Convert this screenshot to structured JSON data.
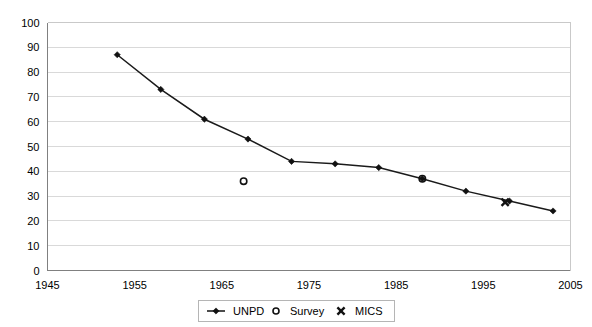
{
  "chart_data": {
    "type": "line",
    "title": "",
    "subtitle": "",
    "xlabel": "",
    "ylabel": "",
    "xlim": [
      1945,
      2005
    ],
    "ylim": [
      0,
      100
    ],
    "grid": true,
    "grid_axis": "y",
    "legend_position": "bottom-center",
    "x_ticks": [
      1945,
      1955,
      1965,
      1975,
      1985,
      1995,
      2005
    ],
    "x_tick_labels": [
      "1945",
      "1955",
      "1965",
      "1975",
      "1985",
      "1995",
      "2005"
    ],
    "y_ticks": [
      0,
      10,
      20,
      30,
      40,
      50,
      60,
      70,
      80,
      90,
      100
    ],
    "y_tick_labels": [
      "0",
      "10",
      "20",
      "30",
      "40",
      "50",
      "60",
      "70",
      "80",
      "90",
      "100"
    ],
    "series": [
      {
        "name": "UNPD",
        "marker": "diamond",
        "style": "line-with-markers",
        "color": "#111111",
        "points": [
          {
            "x": 1953,
            "y": 87
          },
          {
            "x": 1958,
            "y": 73
          },
          {
            "x": 1963,
            "y": 61
          },
          {
            "x": 1968,
            "y": 53
          },
          {
            "x": 1973,
            "y": 44
          },
          {
            "x": 1978,
            "y": 43
          },
          {
            "x": 1983,
            "y": 41.5
          },
          {
            "x": 1988,
            "y": 37
          },
          {
            "x": 1993,
            "y": 32
          },
          {
            "x": 1998,
            "y": 28
          },
          {
            "x": 2003,
            "y": 24
          }
        ]
      },
      {
        "name": "Survey",
        "marker": "open-circle",
        "style": "markers-only",
        "color": "#111111",
        "points": [
          {
            "x": 1967.5,
            "y": 36
          },
          {
            "x": 1988,
            "y": 37
          }
        ]
      },
      {
        "name": "MICS",
        "marker": "x",
        "style": "markers-only",
        "color": "#111111",
        "points": [
          {
            "x": 1997.5,
            "y": 27.5
          }
        ]
      }
    ]
  },
  "legend": {
    "entries": [
      {
        "label": "UNPD",
        "marker": "line-diamond-icon"
      },
      {
        "label": "Survey",
        "marker": "open-circle-icon"
      },
      {
        "label": "MICS",
        "marker": "x-marker-icon"
      }
    ]
  }
}
